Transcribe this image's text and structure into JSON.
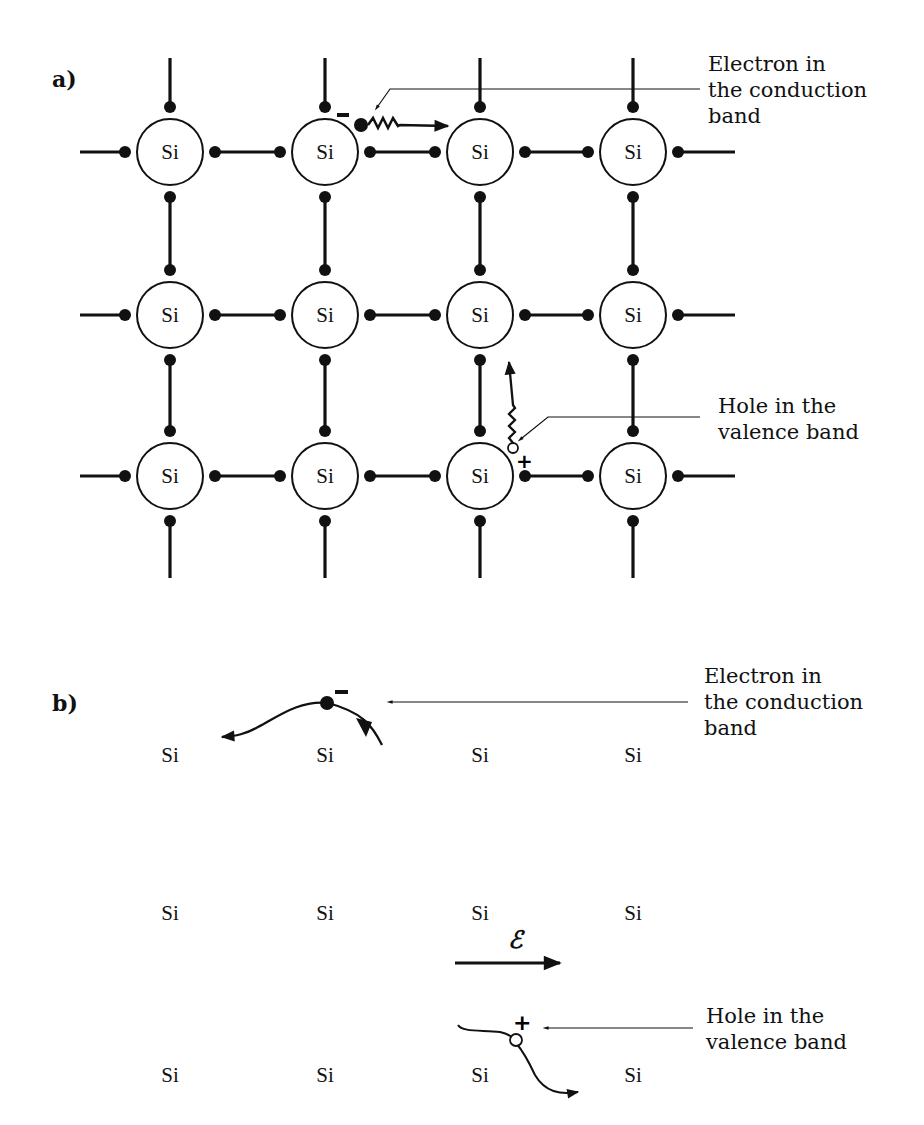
{
  "figure": {
    "parts": {
      "a": {
        "label": "a)"
      },
      "b": {
        "label": "b)"
      }
    },
    "atom_label": "Si",
    "part_a": {
      "columns_x": [
        170,
        325,
        480,
        633
      ],
      "rows_y": [
        152,
        315,
        476
      ],
      "atom_radius": 33,
      "electron_label": [
        "Electron in",
        "the conduction",
        "band"
      ],
      "hole_label": [
        "Hole in the",
        "valence band"
      ],
      "electron_sign": "−",
      "hole_sign": "+"
    },
    "part_b": {
      "columns_x": [
        170,
        325,
        480,
        633
      ],
      "rows_y": [
        762,
        920,
        1082
      ],
      "electron_label": [
        "Electron in",
        "the conduction",
        "band"
      ],
      "hole_label": [
        "Hole in the",
        "valence band"
      ],
      "field_symbol": "ℰ",
      "electron_sign": "−",
      "hole_sign": "+"
    },
    "colors": {
      "ink": "#111111",
      "background": "#ffffff"
    }
  }
}
